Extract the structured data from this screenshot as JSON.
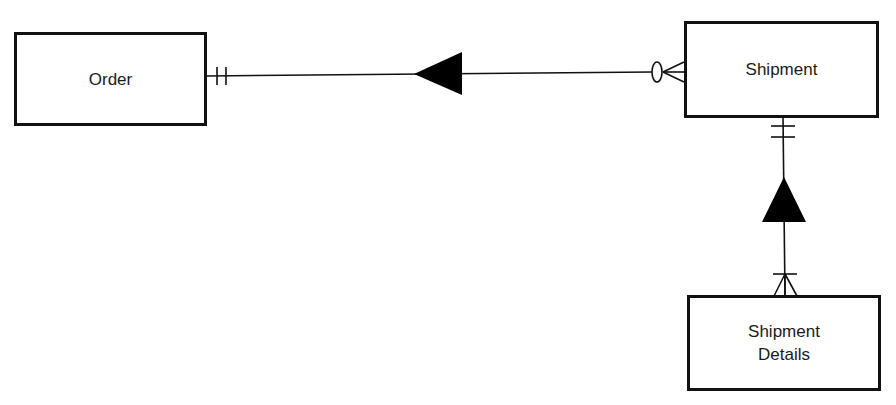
{
  "diagram": {
    "type": "entity-relationship",
    "entities": [
      {
        "id": "order",
        "label": "Order"
      },
      {
        "id": "shipment",
        "label": "Shipment"
      },
      {
        "id": "shipment_details",
        "label": "Shipment\nDetails"
      }
    ],
    "relationships": [
      {
        "from": "order",
        "to": "shipment",
        "from_cardinality": "one-and-only-one",
        "to_cardinality": "zero-or-many",
        "direction_arrow": "points-to-order"
      },
      {
        "from": "shipment",
        "to": "shipment_details",
        "from_cardinality": "one-and-only-one",
        "to_cardinality": "one-or-many",
        "direction_arrow": "points-to-shipment"
      }
    ],
    "colors": {
      "line": "#111111",
      "background": "#ffffff",
      "text": "#1a1a1a"
    }
  }
}
